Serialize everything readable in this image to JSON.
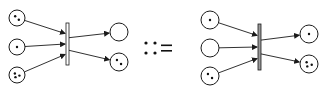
{
  "diagram": {
    "type": "petri-net-rewrite-rule",
    "operator_symbol": "::=",
    "colors": {
      "stroke": "#1a1a1a",
      "token": "#111111",
      "left_bar_fill": "#ffffff",
      "right_bar_fill": "#9a9a9a",
      "background": "#ffffff"
    },
    "left_net": {
      "transition": {
        "x": 66,
        "y": 23,
        "w": 3,
        "h": 42
      },
      "input_places": [
        {
          "id": "L-in-1",
          "cx": 17,
          "cy": 18,
          "r": 8,
          "tokens": 2
        },
        {
          "id": "L-in-2",
          "cx": 17,
          "cy": 47,
          "r": 8,
          "tokens": 1
        },
        {
          "id": "L-in-3",
          "cx": 17,
          "cy": 75,
          "r": 8,
          "tokens": 3
        }
      ],
      "output_places": [
        {
          "id": "L-out-1",
          "cx": 119,
          "cy": 32,
          "r": 9,
          "tokens": 0
        },
        {
          "id": "L-out-2",
          "cx": 119,
          "cy": 62,
          "r": 9,
          "tokens": 2
        }
      ]
    },
    "right_net": {
      "transition": {
        "x": 258,
        "y": 24,
        "w": 3,
        "h": 46
      },
      "input_places": [
        {
          "id": "R-in-1",
          "cx": 210,
          "cy": 20,
          "r": 9,
          "tokens": 1
        },
        {
          "id": "R-in-2",
          "cx": 210,
          "cy": 48,
          "r": 9,
          "tokens": 0
        },
        {
          "id": "R-in-3",
          "cx": 210,
          "cy": 76,
          "r": 9,
          "tokens": 2
        }
      ],
      "output_places": [
        {
          "id": "R-out-1",
          "cx": 309,
          "cy": 34,
          "r": 9,
          "tokens": 1
        },
        {
          "id": "R-out-2",
          "cx": 309,
          "cy": 64,
          "r": 9,
          "tokens": 3
        }
      ]
    }
  }
}
